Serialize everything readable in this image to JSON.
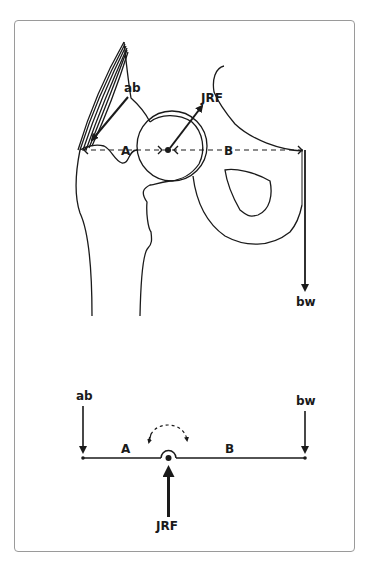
{
  "figure": {
    "type": "hip-lever-diagram",
    "panels": [
      {
        "name": "anatomical-view",
        "labels": {
          "abductor": "ab",
          "joint_reaction_force": "JRF",
          "body_weight": "bw",
          "lever_arm_a": "A",
          "lever_arm_b": "B"
        }
      },
      {
        "name": "lever-schematic",
        "labels": {
          "abductor": "ab",
          "joint_reaction_force": "JRF",
          "body_weight": "bw",
          "lever_arm_a": "A",
          "lever_arm_b": "B"
        }
      }
    ]
  },
  "colors": {
    "line": "#1a1a1a",
    "frame": "#9a9a9a",
    "background": "#ffffff"
  }
}
